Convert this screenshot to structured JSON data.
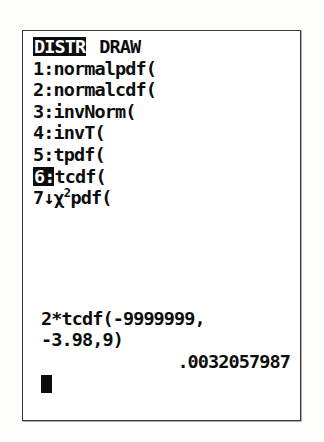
{
  "device": {
    "screen_label": "graphing-calculator-lcd"
  },
  "menu": {
    "tabs": [
      {
        "label": "DISTR",
        "selected": true
      },
      {
        "label": "DRAW",
        "selected": false
      }
    ],
    "items": [
      {
        "marker": "1:",
        "label": "normalpdf(",
        "highlighted": false
      },
      {
        "marker": "2:",
        "label": "normalcdf(",
        "highlighted": false
      },
      {
        "marker": "3:",
        "label": "invNorm(",
        "highlighted": false
      },
      {
        "marker": "4:",
        "label": "invT(",
        "highlighted": false
      },
      {
        "marker": "5:",
        "label": "tpdf(",
        "highlighted": false
      },
      {
        "marker": "6:",
        "label": "tcdf(",
        "highlighted": true
      },
      {
        "marker": "7↓",
        "label_prefix": "χ",
        "label_sup": "2",
        "label_suffix": "pdf(",
        "highlighted": false
      }
    ]
  },
  "home": {
    "entry_line_1": "2*tcdf(-9999999,",
    "entry_line_2": "-3.98,9)",
    "answer": ".0032057987",
    "cursor": "block-cursor"
  },
  "colors": {
    "lcd_background": "#ffffff",
    "lcd_ink": "#0d0d0d",
    "frame_border": "#3a3a3a",
    "page_background": "#fdfdfc"
  }
}
